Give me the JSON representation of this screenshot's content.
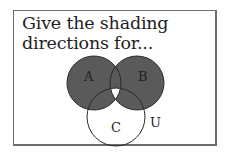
{
  "prompt": {
    "line1": "Give the shading",
    "line2": "directions for..."
  },
  "diagram": {
    "sets": [
      {
        "id": "A",
        "label": "A"
      },
      {
        "id": "B",
        "label": "B"
      },
      {
        "id": "C",
        "label": "C"
      }
    ],
    "universe_label": "U",
    "shaded_region": "(A ∪ B) − (A ∩ B ∩ C)",
    "colors": {
      "shade": "#5a5a5a",
      "outline": "#2a2a2a",
      "background": "#ffffff",
      "frame": "#6e6e6e"
    }
  }
}
